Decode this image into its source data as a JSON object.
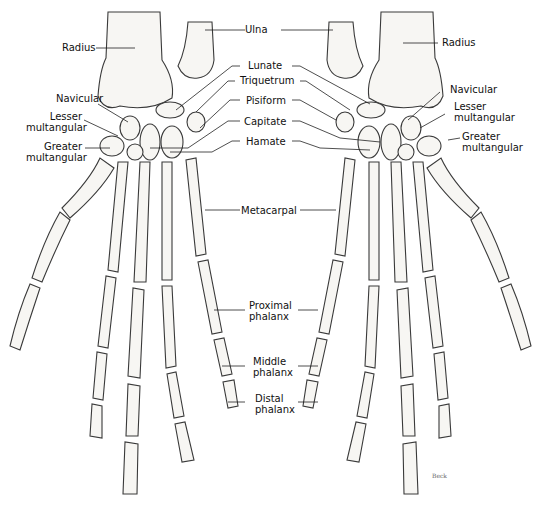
{
  "figure": {
    "type": "anatomical-illustration",
    "signature": "Beck"
  },
  "labels": {
    "ulna": "Ulna",
    "radius_left": "Radius",
    "radius_right": "Radius",
    "lunate": "Lunate",
    "triquetrum": "Triquetrum",
    "pisiform": "Pisiform",
    "capitate": "Capitate",
    "hamate": "Hamate",
    "metacarpal": "Metacarpal",
    "navicular_left": "Navicular",
    "navicular_right": "Navicular",
    "lesser_multangular_left": [
      "Lesser",
      "multangular"
    ],
    "lesser_multangular_right": [
      "Lesser",
      "multangular"
    ],
    "greater_multangular_left": [
      "Greater",
      "multangular"
    ],
    "greater_multangular_right": [
      "Greater",
      "multangular"
    ],
    "proximal_phalanx": [
      "Proximal",
      "phalanx"
    ],
    "middle_phalanx": [
      "Middle",
      "phalanx"
    ],
    "distal_phalanx": [
      "Distal",
      "phalanx"
    ]
  }
}
